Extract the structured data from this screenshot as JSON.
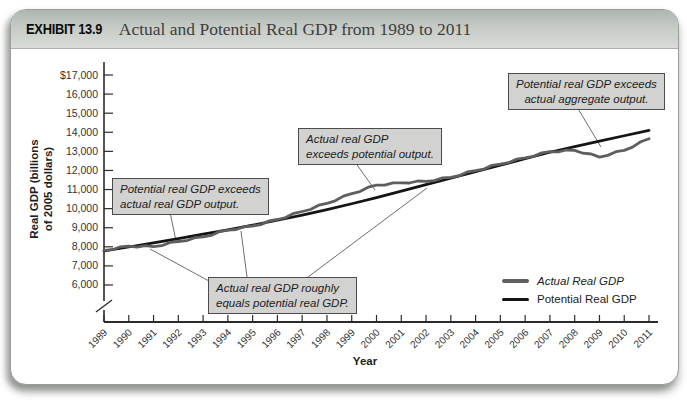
{
  "header": {
    "exhibit_label": "EXHIBIT 13.9",
    "title": "Actual and Potential Real GDP from 1989 to 2011"
  },
  "chart_data": {
    "type": "line",
    "title": "Actual and Potential Real GDP from 1989 to 2011",
    "xlabel": "Year",
    "ylabel": "Real GDP (billions of 2005 dollars)",
    "ylabel_lines": [
      "Real GDP (billions",
      "of 2005 dollars)"
    ],
    "x": [
      1989,
      1990,
      1991,
      1992,
      1993,
      1994,
      1995,
      1996,
      1997,
      1998,
      1999,
      2000,
      2001,
      2002,
      2003,
      2004,
      2005,
      2006,
      2007,
      2008,
      2009,
      2010,
      2011
    ],
    "x_tick_labels": [
      "1989",
      "1990",
      "1991",
      "1992",
      "1993",
      "1994",
      "1995",
      "1996",
      "1997",
      "1998",
      "1999",
      "2000",
      "2001",
      "2002",
      "2003",
      "2004",
      "2005",
      "2006",
      "2007",
      "2008",
      "2009",
      "2010",
      "2011"
    ],
    "series": [
      {
        "name": "Actual Real GDP",
        "color": "#5e5e5e",
        "values": [
          7820,
          8030,
          8010,
          8280,
          8520,
          8870,
          9090,
          9430,
          9850,
          10280,
          10780,
          11230,
          11350,
          11430,
          11640,
          11990,
          12330,
          12660,
          12980,
          13050,
          12700,
          13050,
          13660
        ]
      },
      {
        "name": "Potential Real GDP",
        "color": "#141414",
        "values": [
          7780,
          7990,
          8210,
          8430,
          8660,
          8890,
          9130,
          9390,
          9660,
          9950,
          10260,
          10580,
          10920,
          11260,
          11590,
          11930,
          12270,
          12610,
          12950,
          13250,
          13540,
          13820,
          14100
        ]
      }
    ],
    "y_axis": {
      "tick_values": [
        17000,
        16000,
        15000,
        14000,
        13000,
        12000,
        11000,
        10000,
        9000,
        8000,
        7000,
        6000
      ],
      "tick_labels": [
        "$17,000",
        "16,000",
        "15,000",
        "14,000",
        "13,000",
        "12,000",
        "11,000",
        "10,000",
        "9,000",
        "8,000",
        "7,000",
        "6,000"
      ],
      "range_shown": [
        6000,
        17000
      ],
      "axis_break_at_bottom": true
    },
    "grid": false,
    "legend_position": "lower-right"
  },
  "annotations": [
    {
      "lines": [
        "Potential real GDP exceeds",
        "actual real GDP output."
      ]
    },
    {
      "lines": [
        "Actual real GDP",
        "exceeds potential output."
      ]
    },
    {
      "lines": [
        "Potential real GDP exceeds",
        "actual aggregate output."
      ]
    },
    {
      "lines": [
        "Actual real GDP roughly",
        "equals potential real GDP."
      ]
    }
  ],
  "legend": {
    "items": [
      {
        "label": "Actual Real GDP"
      },
      {
        "label": "Potential Real GDP"
      }
    ]
  },
  "axis_titles": {
    "x": "Year"
  }
}
